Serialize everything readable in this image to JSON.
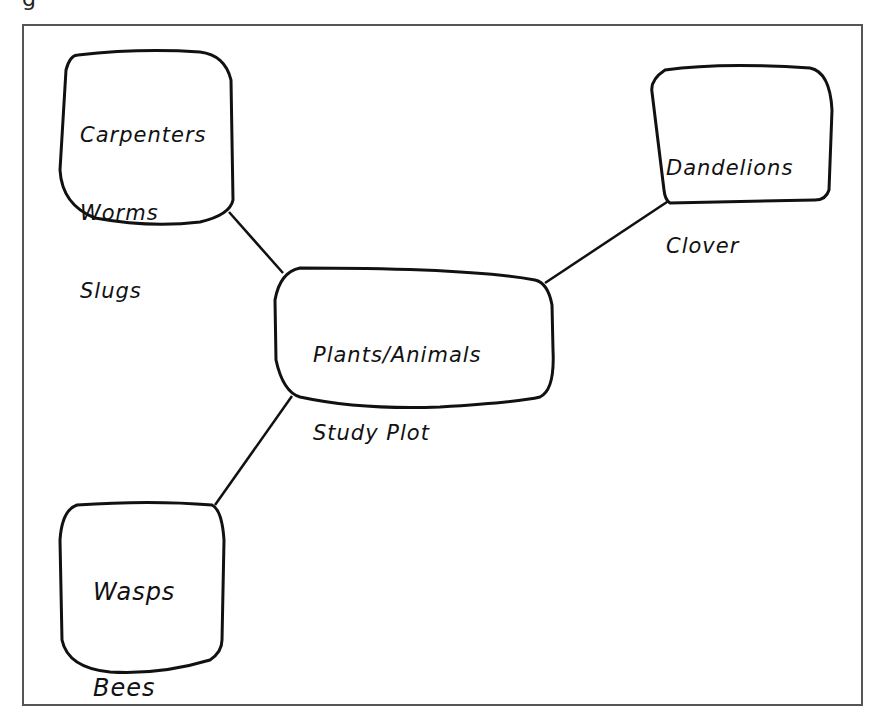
{
  "diagram": {
    "type": "web / concept map",
    "stroke_color": "#111111",
    "frame_color": "#555555",
    "top_fragment": "g",
    "center": {
      "lines": [
        "Plants/Animals",
        "Study Plot"
      ]
    },
    "nodes": [
      {
        "id": "top-left",
        "lines": [
          "Carpenters",
          "Worms",
          "Slugs"
        ]
      },
      {
        "id": "top-right",
        "lines": [
          "Dandelions",
          "Clover"
        ]
      },
      {
        "id": "bottom-left",
        "lines": [
          "Wasps",
          "Bees"
        ]
      }
    ],
    "edges": [
      {
        "from": "center",
        "to": "top-left"
      },
      {
        "from": "center",
        "to": "top-right"
      },
      {
        "from": "center",
        "to": "bottom-left"
      }
    ]
  }
}
